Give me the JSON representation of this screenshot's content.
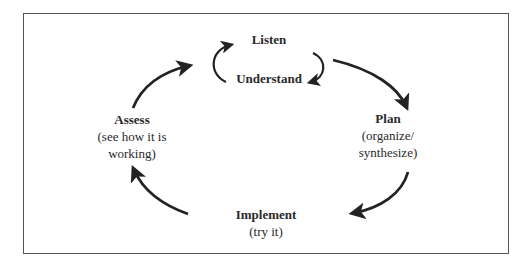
{
  "diagram": {
    "type": "cycle",
    "nodes": [
      {
        "id": "listen",
        "title": "Listen",
        "subtitle_lines": []
      },
      {
        "id": "understand",
        "title": "Understand",
        "subtitle_lines": []
      },
      {
        "id": "plan",
        "title": "Plan",
        "subtitle_lines": [
          "(organize/",
          "synthesize)"
        ]
      },
      {
        "id": "implement",
        "title": "Implement",
        "subtitle_lines": [
          "(try it)"
        ]
      },
      {
        "id": "assess",
        "title": "Assess",
        "subtitle_lines": [
          "(see how it is",
          "working)"
        ]
      }
    ],
    "edges": [
      {
        "from": "listen",
        "to": "understand"
      },
      {
        "from": "understand",
        "to": "listen"
      },
      {
        "from": "listen",
        "to": "plan"
      },
      {
        "from": "plan",
        "to": "implement"
      },
      {
        "from": "implement",
        "to": "assess"
      },
      {
        "from": "assess",
        "to": "listen"
      }
    ],
    "colors": {
      "border": "#555555",
      "arrow": "#222222",
      "text": "#2a2a2a"
    }
  }
}
